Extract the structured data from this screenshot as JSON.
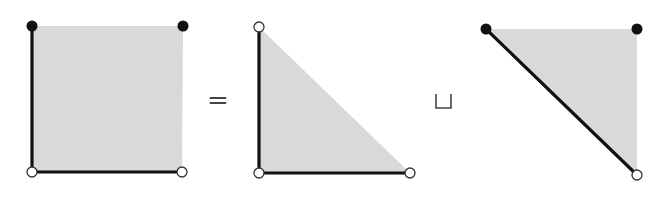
{
  "diagram": {
    "operators": {
      "equals": "=",
      "disjoint_union": "⊔"
    },
    "colors": {
      "fill": "#d9d9d9",
      "edge": "#111111",
      "closed_vertex": "#111111",
      "open_vertex": "#ffffff"
    },
    "shapes": [
      {
        "name": "square",
        "vertices": [
          {
            "pos": "top-left",
            "x": 32,
            "y": 26,
            "type": "closed"
          },
          {
            "pos": "top-right",
            "x": 183,
            "y": 26,
            "type": "closed"
          },
          {
            "pos": "bottom-left",
            "x": 32,
            "y": 172,
            "type": "open"
          },
          {
            "pos": "bottom-right",
            "x": 182,
            "y": 172,
            "type": "open"
          }
        ],
        "bold_edges": [
          "left",
          "bottom"
        ]
      },
      {
        "name": "lower-left-triangle",
        "vertices": [
          {
            "pos": "top-left",
            "x": 259,
            "y": 27,
            "type": "open"
          },
          {
            "pos": "bottom-left",
            "x": 259,
            "y": 173,
            "type": "open"
          },
          {
            "pos": "bottom-right",
            "x": 410,
            "y": 173,
            "type": "open"
          }
        ],
        "bold_edges": [
          "left",
          "bottom"
        ]
      },
      {
        "name": "upper-right-triangle",
        "vertices": [
          {
            "pos": "top-left",
            "x": 486,
            "y": 29,
            "type": "closed"
          },
          {
            "pos": "top-right",
            "x": 637,
            "y": 29,
            "type": "closed"
          },
          {
            "pos": "bottom-right",
            "x": 637,
            "y": 175,
            "type": "open"
          }
        ],
        "bold_edges": [
          "diagonal"
        ]
      }
    ]
  }
}
